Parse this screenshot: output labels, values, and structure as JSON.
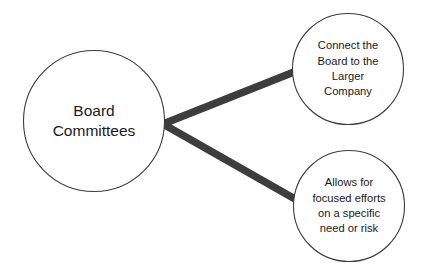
{
  "diagram": {
    "type": "node-branch-diagram",
    "background_color": "#ffffff",
    "node_fill_color": "#ffffff",
    "node_stroke_color": "#3c3c3c",
    "connector_color": "#3d3d3d",
    "text_color": "#1a1a1a",
    "root": {
      "id": "board-committees",
      "lines": [
        "Board",
        "Committees"
      ],
      "cx": 94,
      "cy": 121,
      "r": 70.5
    },
    "branches": [
      {
        "id": "connect-board-to-larger-company",
        "lines": [
          "Connect the",
          "Board to the",
          "Larger",
          "Company"
        ],
        "cx": 348,
        "cy": 69,
        "r": 55.5
      },
      {
        "id": "allows-for-focused-efforts",
        "lines": [
          "Allows for",
          "focused efforts",
          "on a specific",
          "need or risk"
        ],
        "cx": 349,
        "cy": 206,
        "r": 55.5
      }
    ],
    "connectors": [
      {
        "id": "connector-to-top-branch",
        "x1": 163,
        "y1": 124,
        "x2": 294,
        "y2": 72,
        "width": 7.5
      },
      {
        "id": "connector-to-bottom-branch",
        "x1": 163,
        "y1": 124,
        "x2": 295,
        "y2": 199,
        "width": 7.5
      }
    ]
  }
}
